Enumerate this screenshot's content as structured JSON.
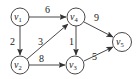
{
  "diagram": {
    "type": "directed-weighted-graph",
    "nodes": [
      {
        "id": "v1",
        "base": "v",
        "sub": "1",
        "x": 20,
        "y": 17
      },
      {
        "id": "v2",
        "base": "v",
        "sub": "2",
        "x": 20,
        "y": 65
      },
      {
        "id": "v3",
        "base": "v",
        "sub": "3",
        "x": 75,
        "y": 65
      },
      {
        "id": "v4",
        "base": "v",
        "sub": "4",
        "x": 76,
        "y": 17
      },
      {
        "id": "v5",
        "base": "v",
        "sub": "5",
        "x": 122,
        "y": 42
      }
    ],
    "edges": [
      {
        "from": "v1",
        "to": "v4",
        "weight": "6"
      },
      {
        "from": "v1",
        "to": "v2",
        "weight": "2"
      },
      {
        "from": "v2",
        "to": "v4",
        "weight": "3"
      },
      {
        "from": "v4",
        "to": "v3",
        "weight": "1"
      },
      {
        "from": "v2",
        "to": "v3",
        "weight": "8"
      },
      {
        "from": "v4",
        "to": "v5",
        "weight": "9"
      },
      {
        "from": "v3",
        "to": "v5",
        "weight": "5"
      }
    ]
  }
}
